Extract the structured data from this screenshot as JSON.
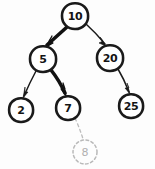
{
  "diagram": {
    "style": "hand-drawn",
    "background_color": "#fdfdfd",
    "ink_color": "#1a1a1a",
    "ghost_color": "#bcbcbc",
    "highlight_color": "#111111"
  },
  "nodes": [
    {
      "id": "n10",
      "label": "10",
      "cx": 75,
      "cy": 16,
      "r": 13,
      "state": "normal",
      "role": "root"
    },
    {
      "id": "n5",
      "label": "5",
      "cx": 43,
      "cy": 59,
      "r": 13,
      "state": "normal",
      "role": "left-child"
    },
    {
      "id": "n20",
      "label": "20",
      "cx": 110,
      "cy": 58,
      "r": 13,
      "state": "normal",
      "role": "right-child"
    },
    {
      "id": "n2",
      "label": "2",
      "cx": 21,
      "cy": 110,
      "r": 12,
      "state": "normal",
      "role": "leaf"
    },
    {
      "id": "n7",
      "label": "7",
      "cx": 68,
      "cy": 108,
      "r": 12,
      "state": "normal",
      "role": "leaf"
    },
    {
      "id": "n25",
      "label": "25",
      "cx": 131,
      "cy": 106,
      "r": 12,
      "state": "normal",
      "role": "leaf"
    },
    {
      "id": "n8",
      "label": "8",
      "cx": 85,
      "cy": 152,
      "r": 12,
      "state": "ghost",
      "role": "inserted-node"
    }
  ],
  "edges": [
    {
      "id": "e10-5",
      "from": "n10",
      "to": "n5",
      "style": "bold",
      "arrow": true
    },
    {
      "id": "e10-20",
      "from": "n10",
      "to": "n20",
      "style": "thin",
      "arrow": true
    },
    {
      "id": "e5-2",
      "from": "n5",
      "to": "n2",
      "style": "thin",
      "arrow": true
    },
    {
      "id": "e5-7",
      "from": "n5",
      "to": "n7",
      "style": "bold",
      "arrow": true
    },
    {
      "id": "e20-25",
      "from": "n20",
      "to": "n25",
      "style": "thin",
      "arrow": true
    },
    {
      "id": "e7-8",
      "from": "n7",
      "to": "n8",
      "style": "dashed",
      "arrow": false
    }
  ]
}
